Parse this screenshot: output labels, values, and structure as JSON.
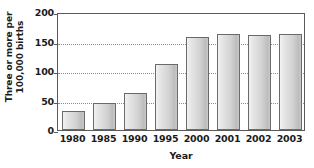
{
  "chart_data": {
    "type": "bar",
    "title": "",
    "xlabel": "Year",
    "ylabel": "Three or more per 100,000 births",
    "ylabel_lines": [
      "Three or more per",
      "100,000 births"
    ],
    "categories": [
      "1980",
      "1985",
      "1990",
      "1995",
      "2000",
      "2001",
      "2002",
      "2003"
    ],
    "values": [
      33,
      45,
      62,
      112,
      158,
      163,
      161,
      163
    ],
    "ylim": [
      0,
      200
    ],
    "yticks": [
      0,
      50,
      100,
      150,
      200
    ],
    "ytick_labels": [
      "0",
      "50",
      "100",
      "150",
      "200"
    ],
    "grid": true,
    "grid_axis": "y",
    "grid_style": "dotted",
    "legend": "none",
    "series": [
      {
        "name": "Three or more per 100,000 births",
        "values": [
          33,
          45,
          62,
          112,
          158,
          163,
          161,
          163
        ]
      }
    ]
  },
  "style": {
    "bar_border_color": "#6a6a6a",
    "bar_fill_light": "#f2f2f2",
    "bar_fill_dark": "#bdbdbd",
    "axis_color": "#5a5a5a",
    "gridline_color": "#8d8d8d",
    "text_color": "#1b1b1b",
    "background": "#ffffff"
  }
}
